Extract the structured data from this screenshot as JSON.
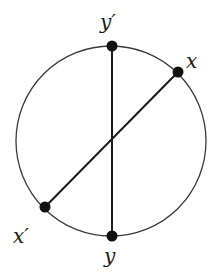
{
  "diagram": {
    "circle": {
      "cx": 111,
      "cy": 141,
      "r": 95,
      "stroke": "#3a3a3a"
    },
    "points": [
      {
        "id": "y_prime",
        "label": "y′",
        "x": 112,
        "y": 46,
        "label_x": 100,
        "label_y": 29
      },
      {
        "id": "x",
        "label": "x",
        "x": 178,
        "y": 72,
        "label_x": 186,
        "label_y": 68
      },
      {
        "id": "x_prime",
        "label": "x′",
        "x": 45,
        "y": 207,
        "label_x": 13,
        "label_y": 243
      },
      {
        "id": "y",
        "label": "y",
        "x": 112,
        "y": 236,
        "label_x": 104,
        "label_y": 263
      }
    ],
    "chords": [
      {
        "from": "y_prime",
        "to": "y"
      },
      {
        "from": "x",
        "to": "x_prime"
      }
    ],
    "point_color": "#111111",
    "chord_color": "#1a1a1a"
  }
}
